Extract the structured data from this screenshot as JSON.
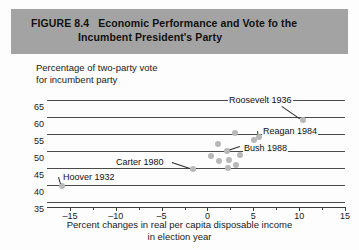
{
  "figure": {
    "number_label": "FIGURE 8.4",
    "title_line1": "Economic Performance and Vote fo the",
    "title_line2": "Incumbent President's Party",
    "header_color": "#a3a3a3"
  },
  "chart_data": {
    "type": "scatter",
    "title": "Economic Performance and Vote fo the Incumbent President's Party",
    "xlabel": "Percent changes in real per capita disposable income in election year",
    "xlabel_line1": "Percent changes in real per capita disposable income",
    "xlabel_line2": "in election year",
    "ylabel": "Percentage of two-party vote for incumbent party",
    "ylabel_line1": "Percentage of two-party vote",
    "ylabel_line2": "for incumbent party",
    "xlim": [
      -17.5,
      15
    ],
    "ylim": [
      35,
      65
    ],
    "xticks": [
      -15,
      -10,
      -5,
      0,
      5,
      10,
      15
    ],
    "xtick_labels": [
      "–15",
      "–10",
      "–5",
      "0",
      "5",
      "10",
      "15"
    ],
    "xticks_minor": [
      -12.5,
      -7.5,
      -2.5,
      2.5,
      7.5,
      12.5
    ],
    "yticks": [
      35,
      40,
      45,
      50,
      55,
      60,
      65
    ],
    "ytick_labels": [
      "35",
      "40",
      "45",
      "50",
      "55",
      "60",
      "65"
    ],
    "grid": "horizontal",
    "legend": "none",
    "marker_color": "#b8b8b8",
    "points": [
      {
        "x": -15.9,
        "y": 39.6,
        "label": "Hoover 1932"
      },
      {
        "x": -1.6,
        "y": 44.7,
        "label": "Carter 1980"
      },
      {
        "x": 2.2,
        "y": 44.9,
        "label": ""
      },
      {
        "x": 3.1,
        "y": 45.9,
        "label": ""
      },
      {
        "x": 1.3,
        "y": 47.2,
        "label": ""
      },
      {
        "x": 2.4,
        "y": 47.4,
        "label": ""
      },
      {
        "x": 0.4,
        "y": 48.6,
        "label": ""
      },
      {
        "x": 3.6,
        "y": 48.8,
        "label": ""
      },
      {
        "x": 2.1,
        "y": 49.9,
        "label": "Bush 1988"
      },
      {
        "x": 4.2,
        "y": 51.0,
        "label": ""
      },
      {
        "x": 1.2,
        "y": 52.2,
        "label": ""
      },
      {
        "x": 5.1,
        "y": 53.1,
        "label": ""
      },
      {
        "x": 5.6,
        "y": 54.1,
        "label": "Reagan 1984"
      },
      {
        "x": 3.0,
        "y": 55.3,
        "label": ""
      },
      {
        "x": 10.4,
        "y": 59.0,
        "label": "Roosevelt 1936"
      }
    ],
    "annotations": [
      {
        "text": "Roosevelt 1936",
        "target_x": 10.4,
        "target_y": 59.0
      },
      {
        "text": "Reagan 1984",
        "target_x": 5.6,
        "target_y": 54.1
      },
      {
        "text": "Bush 1988",
        "target_x": 2.1,
        "target_y": 49.9
      },
      {
        "text": "Carter 1980",
        "target_x": -1.6,
        "target_y": 44.7
      },
      {
        "text": "Hoover 1932",
        "target_x": -15.9,
        "target_y": 39.6
      }
    ]
  }
}
